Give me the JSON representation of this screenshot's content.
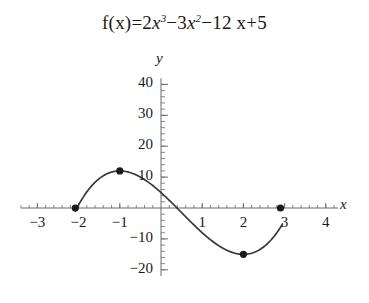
{
  "figure": {
    "title_parts": {
      "fx": "f(x)=2",
      "x1": "x",
      "p1": "3",
      "minus3": "−3",
      "x2": "x",
      "p2": "2",
      "tail": "−12 x+5"
    },
    "title_plain": "f(x)=2x^3-3x^2-12 x+5"
  },
  "chart_data": {
    "type": "line",
    "function": "f(x) = 2x^3 - 3x^2 - 12x + 5",
    "xlabel": "x",
    "ylabel": "y",
    "xlim": [
      -3.4,
      4.3
    ],
    "ylim": [
      -22,
      42
    ],
    "x_ticks": [
      -3,
      -2,
      -1,
      1,
      2,
      3,
      4
    ],
    "x_tick_labels": [
      "−3",
      "−2",
      "−1",
      "1",
      "2",
      "3",
      "4"
    ],
    "y_ticks": [
      40,
      30,
      20,
      10,
      -10,
      -20
    ],
    "y_tick_labels": [
      "40",
      "30",
      "20",
      "10",
      "−10",
      "−20"
    ],
    "minor_tick_step": 0.2,
    "y_minor_tick_step": 2,
    "grid": false,
    "legend": null,
    "curve_color": "#3a3a3a",
    "axis_color": "#6b6b6b",
    "marker_color": "#1a1a1a",
    "curve_domain": [
      -2.08,
      2.95
    ],
    "points": [
      {
        "label": "root-left",
        "x": -2.08,
        "y": 0
      },
      {
        "label": "local-maximum",
        "x": -1.0,
        "y": 12
      },
      {
        "label": "local-minimum",
        "x": 2.0,
        "y": -15
      },
      {
        "label": "root-right",
        "x": 2.9,
        "y": 0
      }
    ],
    "x": [
      -2.08,
      -1.9,
      -1.7,
      -1.5,
      -1.3,
      -1.1,
      -1.0,
      -0.9,
      -0.7,
      -0.5,
      -0.3,
      -0.1,
      0.1,
      0.3,
      0.5,
      0.7,
      0.9,
      1.1,
      1.3,
      1.5,
      1.7,
      1.9,
      2.0,
      2.1,
      2.3,
      2.5,
      2.7,
      2.9,
      2.95
    ],
    "values": [
      0.1,
      3.6,
      6.9,
      9.5,
      11.4,
      11.96,
      12.0,
      11.8,
      10.9,
      9.5,
      7.7,
      5.6,
      3.3,
      1.0,
      -1.5,
      -3.9,
      -6.2,
      -8.3,
      -10.2,
      -11.5,
      -12.5,
      -13.0,
      -15.0,
      -13.0,
      -12.4,
      -11.3,
      -9.3,
      -6.2,
      0.2
    ]
  }
}
